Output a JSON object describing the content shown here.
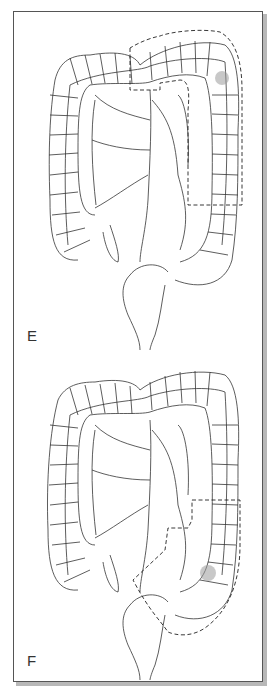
{
  "figure": {
    "colors": {
      "outline": "#333333",
      "dashed_margin": "#222222",
      "lesion": "#9a9a9a",
      "frame_border": "#555555",
      "frame_shadow": "#b8b8b8"
    },
    "panels": [
      {
        "label": "E",
        "lesion_location": "upper left colon (splenic flexure)",
        "resection_region": "distal transverse colon and descending colon"
      },
      {
        "label": "F",
        "lesion_location": "sigmoid colon",
        "resection_region": "lower descending and sigmoid colon"
      }
    ]
  }
}
